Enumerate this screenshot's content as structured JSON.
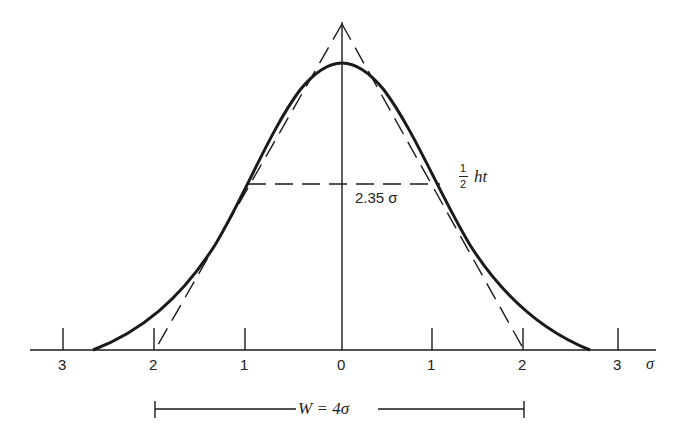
{
  "diagram": {
    "axis": {
      "unit_label": "σ",
      "ticks": [
        {
          "label": "3",
          "value": -3
        },
        {
          "label": "2",
          "value": -2
        },
        {
          "label": "1",
          "value": -1
        },
        {
          "label": "0",
          "value": 0
        },
        {
          "label": "1",
          "value": 1
        },
        {
          "label": "2",
          "value": 2
        },
        {
          "label": "3",
          "value": 3
        }
      ]
    },
    "half_height": {
      "width_label": "2.35 σ",
      "fraction_numerator": "1",
      "fraction_denominator": "2",
      "suffix": "ht"
    },
    "base_width": {
      "label": "W = 4σ"
    },
    "colors": {
      "ink": "#1a1a1a",
      "background": "#ffffff"
    }
  }
}
